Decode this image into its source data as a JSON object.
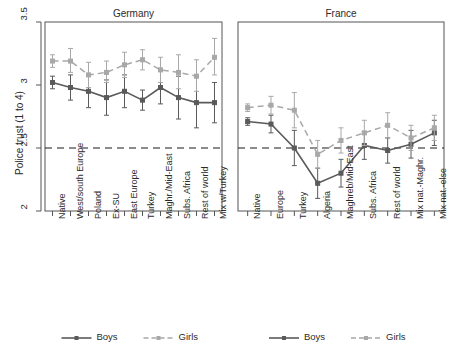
{
  "chart_data": {
    "type": "line",
    "title": "",
    "ylabel": "Police trust (1 to 4)",
    "xlabel": "",
    "ylim": [
      2,
      3.5
    ],
    "yticks": [
      2,
      2.5,
      3,
      3.5
    ],
    "ytick_labels": [
      "2",
      "2.5",
      "3",
      "3.5"
    ],
    "grid": false,
    "reference_line": 2.5,
    "legend_position": "bottom",
    "legend_entries": [
      "Boys",
      "Girls"
    ],
    "colors": {
      "boys": "#5a5a5a",
      "girls": "#a8a8a8",
      "axis": "#555555",
      "text": "#2b2b2b",
      "reference_line": "#1a1a1a"
    },
    "panels": [
      {
        "title": "Germany",
        "categories": [
          "Native",
          "West/south Europe",
          "Poland",
          "Ex-SU",
          "East Europe",
          "Turkey",
          "Maghr./Mid-East",
          "Subs. Africa",
          "Rest of world",
          "Mix w/Turkey"
        ],
        "series": [
          {
            "name": "Boys",
            "values": [
              3.02,
              2.98,
              2.95,
              2.9,
              2.95,
              2.88,
              2.98,
              2.9,
              2.86,
              2.86
            ],
            "ci_low": [
              2.97,
              2.88,
              2.82,
              2.76,
              2.82,
              2.8,
              2.85,
              2.73,
              2.66,
              2.7
            ],
            "ci_high": [
              3.07,
              3.08,
              3.08,
              3.04,
              3.08,
              2.96,
              3.11,
              3.07,
              3.06,
              3.02
            ]
          },
          {
            "name": "Girls",
            "values": [
              3.19,
              3.19,
              3.08,
              3.1,
              3.16,
              3.2,
              3.12,
              3.1,
              3.07,
              3.22
            ],
            "ci_low": [
              3.14,
              3.1,
              2.98,
              3.02,
              3.06,
              3.12,
              3.02,
              2.97,
              2.95,
              3.08
            ],
            "ci_high": [
              3.24,
              3.29,
              3.18,
              3.19,
              3.26,
              3.28,
              3.22,
              3.24,
              3.2,
              3.37
            ]
          }
        ]
      },
      {
        "title": "France",
        "categories": [
          "Native",
          "Europe",
          "Turkey",
          "Algeria",
          "Maghreb/Mid-East",
          "Subs. Africa",
          "Rest of world",
          "Mix nat.-Maghr.",
          "Mix nat.-else"
        ],
        "series": [
          {
            "name": "Boys",
            "values": [
              2.71,
              2.69,
              2.5,
              2.22,
              2.3,
              2.52,
              2.48,
              2.53,
              2.62
            ],
            "ci_low": [
              2.68,
              2.62,
              2.36,
              2.1,
              2.19,
              2.41,
              2.38,
              2.42,
              2.52
            ],
            "ci_high": [
              2.74,
              2.76,
              2.64,
              2.34,
              2.41,
              2.63,
              2.58,
              2.64,
              2.72
            ]
          },
          {
            "name": "Girls",
            "values": [
              2.82,
              2.84,
              2.8,
              2.45,
              2.56,
              2.62,
              2.68,
              2.58,
              2.66
            ],
            "ci_low": [
              2.79,
              2.77,
              2.66,
              2.34,
              2.46,
              2.52,
              2.58,
              2.48,
              2.56
            ],
            "ci_high": [
              2.85,
              2.91,
              2.94,
              2.56,
              2.66,
              2.72,
              2.78,
              2.68,
              2.76
            ]
          }
        ]
      }
    ]
  }
}
